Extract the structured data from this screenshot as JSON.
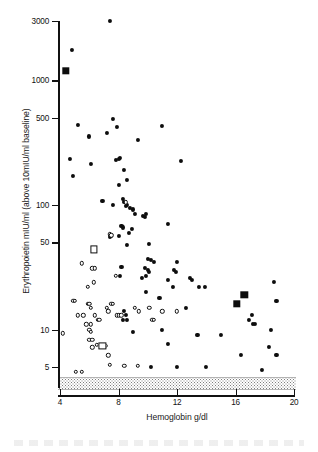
{
  "figure": {
    "type": "scatter-plot",
    "background": "#ffffff",
    "ink_color": "#0d0d0d"
  },
  "chart_data": {
    "type": "scatter",
    "title": "",
    "xlabel": "Hemoglobin g/dl",
    "ylabel": "Erythropoietin mIU/ml (above 10mIU/ml baseline)",
    "xlim": [
      4,
      20
    ],
    "ylim": [
      5,
      3000
    ],
    "xscale": "linear",
    "yscale": "log",
    "grid": false,
    "legend": "none",
    "xticks": [
      4,
      8,
      12,
      16,
      20
    ],
    "xticklabels": [
      "4",
      "8",
      "12",
      "16",
      "20"
    ],
    "yticks": [
      5,
      10,
      50,
      100,
      500,
      1000,
      3000
    ],
    "yticklabels": [
      "5",
      "10",
      "50",
      "100",
      "500",
      "1000",
      "3000"
    ],
    "annotations": [
      {
        "name": "detection-limit-band",
        "kind": "shaded-horizontal-band",
        "y_top": 5.6,
        "y_bottom": 4.5,
        "fill": "stippled-grey",
        "label": ""
      }
    ],
    "series": [
      {
        "name": "filled-circles",
        "marker": "filled-circle",
        "color": "#0d0d0d",
        "points": [
          [
            7.4,
            3000
          ],
          [
            4.8,
            1750
          ],
          [
            5.2,
            440
          ],
          [
            7.6,
            490
          ],
          [
            7.9,
            425
          ],
          [
            6.0,
            355
          ],
          [
            7.2,
            380
          ],
          [
            11.0,
            430
          ],
          [
            9.3,
            330
          ],
          [
            4.7,
            235
          ],
          [
            6.1,
            215
          ],
          [
            7.8,
            230
          ],
          [
            8.1,
            240
          ],
          [
            8.0,
            235
          ],
          [
            12.3,
            225
          ],
          [
            4.9,
            170
          ],
          [
            8.4,
            190
          ],
          [
            8.6,
            160
          ],
          [
            8.0,
            145
          ],
          [
            6.9,
            108
          ],
          [
            7.6,
            100
          ],
          [
            8.3,
            112
          ],
          [
            8.4,
            105
          ],
          [
            8.6,
            100
          ],
          [
            8.5,
            98
          ],
          [
            8.8,
            95
          ],
          [
            9.0,
            92
          ],
          [
            8.2,
            68
          ],
          [
            8.3,
            66
          ],
          [
            9.1,
            85
          ],
          [
            9.7,
            82
          ],
          [
            9.8,
            80
          ],
          [
            9.9,
            84
          ],
          [
            11.4,
            70
          ],
          [
            8.7,
            60
          ],
          [
            8.0,
            56
          ],
          [
            8.9,
            64
          ],
          [
            7.5,
            56
          ],
          [
            7.4,
            55
          ],
          [
            8.6,
            48
          ],
          [
            10.1,
            49
          ],
          [
            10.0,
            37
          ],
          [
            10.2,
            36
          ],
          [
            10.4,
            35
          ],
          [
            12.0,
            35
          ],
          [
            9.8,
            31
          ],
          [
            10.0,
            30
          ],
          [
            10.1,
            29
          ],
          [
            11.8,
            30
          ],
          [
            11.9,
            29
          ],
          [
            8.2,
            32
          ],
          [
            8.1,
            27
          ],
          [
            9.9,
            27
          ],
          [
            9.6,
            26
          ],
          [
            11.4,
            25
          ],
          [
            12.9,
            26
          ],
          [
            13.0,
            25
          ],
          [
            11.7,
            22
          ],
          [
            13.5,
            22
          ],
          [
            13.9,
            22
          ],
          [
            9.9,
            20
          ],
          [
            10.8,
            18
          ],
          [
            12.6,
            15
          ],
          [
            18.6,
            24
          ],
          [
            18.8,
            17
          ],
          [
            8.4,
            14
          ],
          [
            8.5,
            13
          ],
          [
            8.3,
            12
          ],
          [
            8.6,
            12
          ],
          [
            17.1,
            13
          ],
          [
            17.2,
            11
          ],
          [
            17.3,
            11
          ],
          [
            16.9,
            12
          ],
          [
            11.0,
            10
          ],
          [
            18.4,
            10
          ],
          [
            13.4,
            9
          ],
          [
            15.0,
            9
          ],
          [
            11.4,
            7.6
          ],
          [
            18.3,
            7.3
          ],
          [
            16.4,
            6.2
          ],
          [
            18.8,
            6.2
          ],
          [
            9.0,
            9.5
          ],
          [
            10.2,
            5
          ],
          [
            12.0,
            5
          ],
          [
            14.0,
            5
          ],
          [
            17.8,
            4.7
          ]
        ]
      },
      {
        "name": "open-circles",
        "marker": "open-circle",
        "color": "#0d0d0d",
        "points": [
          [
            8.5,
            105
          ],
          [
            7.4,
            58
          ],
          [
            7.5,
            57
          ],
          [
            7.8,
            27
          ],
          [
            5.5,
            34
          ],
          [
            6.2,
            31
          ],
          [
            6.4,
            31
          ],
          [
            6.3,
            24
          ],
          [
            5.9,
            22
          ],
          [
            4.9,
            17
          ],
          [
            5.0,
            17
          ],
          [
            5.9,
            16
          ],
          [
            6.0,
            16
          ],
          [
            6.1,
            15
          ],
          [
            5.2,
            13
          ],
          [
            6.4,
            13
          ],
          [
            7.2,
            15
          ],
          [
            7.3,
            14
          ],
          [
            7.5,
            16
          ],
          [
            7.6,
            16
          ],
          [
            7.9,
            13
          ],
          [
            8.0,
            13
          ],
          [
            8.2,
            13
          ],
          [
            6.6,
            12
          ],
          [
            6.7,
            12
          ],
          [
            9.1,
            15
          ],
          [
            9.4,
            14
          ],
          [
            10.1,
            15
          ],
          [
            10.3,
            12
          ],
          [
            10.4,
            12
          ],
          [
            11.0,
            14
          ],
          [
            12.0,
            14
          ],
          [
            5.6,
            13
          ],
          [
            5.8,
            11
          ],
          [
            6.1,
            11
          ],
          [
            6.0,
            10
          ],
          [
            6.1,
            9.6
          ],
          [
            4.2,
            9.3
          ],
          [
            6.0,
            8.3
          ],
          [
            6.2,
            8.3
          ],
          [
            6.5,
            7.5
          ],
          [
            7.1,
            7.4
          ],
          [
            6.2,
            7.2
          ],
          [
            7.3,
            6.2
          ],
          [
            7.4,
            5.2
          ],
          [
            8.4,
            5.1
          ],
          [
            9.3,
            5.1
          ],
          [
            5.1,
            4.6
          ],
          [
            5.5,
            4.6
          ]
        ]
      },
      {
        "name": "filled-squares",
        "marker": "filled-square",
        "color": "#0d0d0d",
        "points": [
          [
            4.4,
            1200
          ],
          [
            16.1,
            16
          ],
          [
            16.6,
            19
          ]
        ]
      },
      {
        "name": "open-squares",
        "marker": "open-square",
        "color": "#0d0d0d",
        "points": [
          [
            6.3,
            44
          ],
          [
            6.9,
            7.4
          ]
        ]
      }
    ]
  }
}
